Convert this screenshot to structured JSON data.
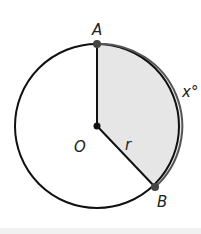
{
  "diagram": {
    "type": "circle-sector",
    "center": {
      "label": "O",
      "x": 97,
      "y": 126
    },
    "radius_px": 82,
    "radius_label": "r",
    "points": [
      {
        "label": "A",
        "x": 97,
        "y": 44
      },
      {
        "label": "B",
        "x": 155,
        "y": 187
      }
    ],
    "arc_label": "x°",
    "colors": {
      "stroke": "#111111",
      "sector_fill": "#e6e6e6",
      "point_fill": "#444444",
      "center_fill": "#111111",
      "label": "#222222"
    }
  }
}
